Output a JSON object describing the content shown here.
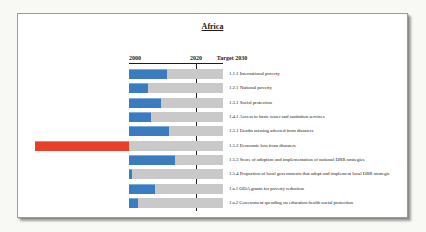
{
  "title": "Africa",
  "axis": {
    "start_label": "2000",
    "mid_label": "2020",
    "end_label": "Target 2030"
  },
  "chart_data": {
    "type": "bar",
    "orientation": "horizontal",
    "title": "Africa",
    "axis_markers": [
      "2000",
      "2020",
      "Target 2030"
    ],
    "value_scale": "percent progress toward Target 2030 (negative = regression, bar drawn left of axis start)",
    "xlim": [
      -100,
      100
    ],
    "marker_2020_position_pct": 71,
    "legend": "none",
    "grid": "off",
    "rows": [
      {
        "label": "1.1.1 International poverty",
        "value": 40
      },
      {
        "label": "1.2.1 National poverty",
        "value": 20
      },
      {
        "label": "1.3.1 Social protection",
        "value": 34
      },
      {
        "label": "1.4.1 Access to basic water and sanitation services",
        "value": 23
      },
      {
        "label": "1.5.1 Deaths missing affected from disasters",
        "value": 43
      },
      {
        "label": "1.5.2 Economic loss from disasters",
        "value": -100
      },
      {
        "label": "1.5.3 Score of adoption and implementation of national DRR strategies",
        "value": 49
      },
      {
        "label": "1.5.4 Proportion of local governments that adopt and implement local DRR strategie",
        "value": 3
      },
      {
        "label": "1.a.1 ODA grants for poverty reduction",
        "value": 28
      },
      {
        "label": "1.a.2 Government spending on education health social protection",
        "value": 10
      }
    ],
    "colors": {
      "progress": "#3b7cc0",
      "regression": "#e6402a",
      "track": "#c9c9c9",
      "axis_line": "#1c1c1c"
    }
  }
}
